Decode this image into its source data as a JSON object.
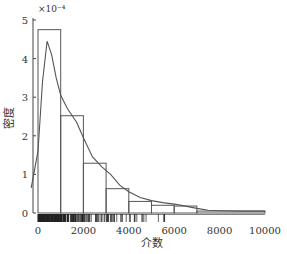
{
  "chart_data": {
    "type": "bar",
    "title": "",
    "xlabel": "介数",
    "ylabel": "密度",
    "y_multiplier": "×10⁻⁴",
    "x_ticks": [
      0,
      2000,
      4000,
      6000,
      8000,
      10000
    ],
    "x_tick_labels": [
      "0",
      "2000",
      "4000",
      "6000",
      "8000",
      "10000"
    ],
    "y_ticks": [
      0,
      1,
      2,
      3,
      4,
      5
    ],
    "y_tick_labels": [
      "0",
      "1",
      "2",
      "3",
      "4",
      "5"
    ],
    "xlim": [
      -300,
      10200
    ],
    "ylim": [
      0,
      5
    ],
    "grid": false,
    "histogram": {
      "bin_edges": [
        0,
        1000,
        2000,
        3000,
        4000,
        5000,
        6000,
        7000,
        10000
      ],
      "densities": [
        4.75,
        2.52,
        1.29,
        0.63,
        0.3,
        0.2,
        0.18,
        0.05
      ]
    },
    "kde_curve": {
      "name": "density estimate",
      "x": [
        -300,
        0,
        200,
        400,
        600,
        800,
        1000,
        1300,
        1700,
        2000,
        2400,
        2800,
        3200,
        3600,
        4000,
        4500,
        5000,
        5500,
        6000,
        6500,
        7000,
        7500,
        8000,
        9000,
        10000
      ],
      "y": [
        0.65,
        1.6,
        3.4,
        4.45,
        4.1,
        3.5,
        3.05,
        2.7,
        2.35,
        1.95,
        1.45,
        1.2,
        1.0,
        0.72,
        0.55,
        0.4,
        0.32,
        0.27,
        0.23,
        0.18,
        0.12,
        0.07,
        0.06,
        0.05,
        0.05
      ]
    },
    "rug": "dense tick marks along x-axis, densest between 0 and 3000, sparse beyond 6000"
  }
}
